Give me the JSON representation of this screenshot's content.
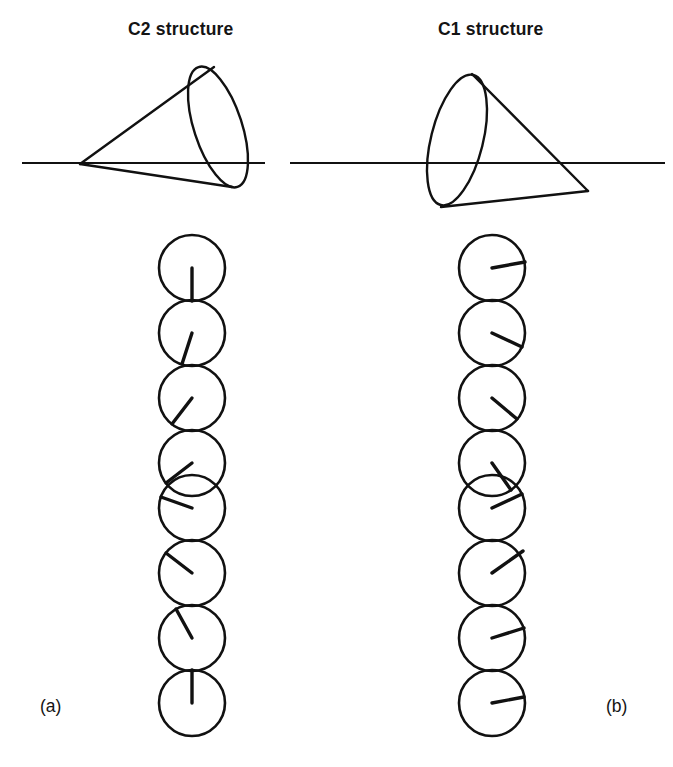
{
  "figure": {
    "caption_labels": {
      "left": "(a)",
      "right": "(b)"
    },
    "panels": [
      {
        "id": "c2",
        "title": "C2 structure",
        "label": "(a)",
        "cone": {
          "apex": [
            80,
            164
          ],
          "ellipse_center": [
            218,
            127
          ],
          "ellipse_rx": 24,
          "ellipse_ry": 63,
          "ellipse_rotation_deg": -18,
          "baseline_y": 163,
          "baseline_x1": 22,
          "baseline_x2": 265,
          "description": "cone apex at left, elliptical base at right, tilted above baseline"
        },
        "chain": {
          "count": 8,
          "center_x": 192,
          "first_center_y": 268,
          "spacing": 65,
          "radius": 33,
          "director_angles_deg": [
            90,
            108,
            127,
            143,
            200,
            218,
            240,
            90
          ],
          "note": "radius line angles measured clockwise from +x axis, drawn from circle center"
        }
      },
      {
        "id": "c1",
        "title": "C1 structure",
        "label": "(b)",
        "cone": {
          "apex": [
            588,
            191
          ],
          "ellipse_center": [
            468,
            137
          ],
          "ellipse_rx": 26,
          "ellipse_ry": 64,
          "ellipse_rotation_deg": 14,
          "baseline_y": 163,
          "baseline_x1": 290,
          "baseline_x2": 665,
          "description": "cone apex at right, elliptical base at left, tilted below baseline"
        },
        "chain": {
          "count": 8,
          "center_x": 492,
          "first_center_y": 268,
          "spacing": 65,
          "radius": 33,
          "director_angles_deg": [
            10,
            25,
            40,
            55,
            335,
            320,
            345,
            350
          ],
          "note": "radius line angles measured clockwise from +x axis, drawn from circle center"
        }
      }
    ],
    "style": {
      "stroke_color": "#111111",
      "background": "#ffffff",
      "circle_stroke_width": 2.6,
      "director_stroke_width": 3.4,
      "cone_stroke_width": 2.4,
      "baseline_stroke_width": 1.9
    }
  }
}
